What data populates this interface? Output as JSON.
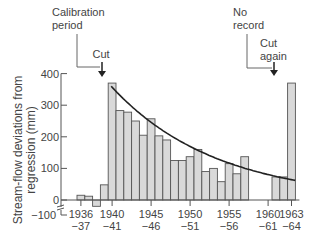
{
  "chart_data": {
    "type": "bar",
    "title": "",
    "ylabel": "Stream-flow deviations from regression (mm)",
    "ylabel_lines": [
      "Stream-flow deviations from",
      "regression (mm)"
    ],
    "xlabel": "",
    "ylim": [
      -100,
      400
    ],
    "yticks": [
      -100,
      0,
      100,
      200,
      300,
      400
    ],
    "ytick_labels": [
      "−100",
      "0",
      "100",
      "200",
      "300",
      "400"
    ],
    "xtick_labels": [
      {
        "top": "1936",
        "bottom": "−37"
      },
      {
        "top": "1940",
        "bottom": "−41"
      },
      {
        "top": "1945",
        "bottom": "−46"
      },
      {
        "top": "1950",
        "bottom": "−51"
      },
      {
        "top": "1955",
        "bottom": "−56"
      },
      {
        "top": "1960",
        "bottom": "−61"
      },
      {
        "top": "1963",
        "bottom": "−64"
      }
    ],
    "categories": [
      "1936-37",
      "1937-38",
      "1938-39",
      "1939-40",
      "1940-41",
      "1941-42",
      "1942-43",
      "1943-44",
      "1944-45",
      "1945-46",
      "1946-47",
      "1947-48",
      "1948-49",
      "1949-50",
      "1950-51",
      "1951-52",
      "1952-53",
      "1953-54",
      "1954-55",
      "1955-56",
      "1956-57",
      "1957-58",
      "1958-59",
      "1959-60",
      "1960-61",
      "1961-62",
      "1962-63",
      "1963-64"
    ],
    "values": [
      15,
      12,
      -20,
      48,
      370,
      283,
      278,
      250,
      205,
      257,
      203,
      190,
      125,
      125,
      137,
      160,
      90,
      100,
      58,
      115,
      83,
      137,
      null,
      null,
      null,
      73,
      73,
      370
    ],
    "trend_curve": {
      "description": "Decaying exponential fit over 1940–1964",
      "start": 360,
      "end": 62
    },
    "annotations": [
      {
        "text_lines": [
          "Calibration",
          "period"
        ],
        "target": "1939-40"
      },
      {
        "text_lines": [
          "Cut"
        ],
        "target": "1939-40",
        "arrow": true
      },
      {
        "text_lines": [
          "No",
          "record"
        ],
        "target": "1962-63"
      },
      {
        "text_lines": [
          "Cut",
          "again"
        ],
        "target": "1962-63",
        "arrow": true
      }
    ],
    "grid": false,
    "bar_color": "#d9d9d9",
    "bar_edge_color": "#555555",
    "curve_color": "#222222"
  }
}
